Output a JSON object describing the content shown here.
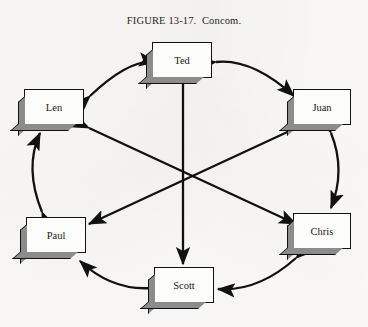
{
  "figure": {
    "caption": "FIGURE 13-17.  Concom.",
    "background_color": "#fbfaf8",
    "ink_color": "#111111",
    "box_fill_color": "#fdfdfb",
    "box_shadow_color": "#8c8c8c"
  },
  "diagram": {
    "type": "directed-graph",
    "layout": "hexagonal-ring-with-diagonals",
    "node_count": 6,
    "edge_count": 9,
    "nodes": [
      {
        "id": "ted",
        "label": "Ted",
        "x": 182,
        "y": 60,
        "w": 60,
        "h": 36
      },
      {
        "id": "juan",
        "label": "Juan",
        "x": 322,
        "y": 107,
        "w": 58,
        "h": 36
      },
      {
        "id": "chris",
        "label": "Chris",
        "x": 322,
        "y": 231,
        "w": 58,
        "h": 36
      },
      {
        "id": "scott",
        "label": "Scott",
        "x": 184,
        "y": 285,
        "w": 60,
        "h": 36
      },
      {
        "id": "paul",
        "label": "Paul",
        "x": 56,
        "y": 235,
        "w": 60,
        "h": 36
      },
      {
        "id": "len",
        "label": "Len",
        "x": 54,
        "y": 107,
        "w": 60,
        "h": 36
      }
    ],
    "ring_edges": [
      {
        "from": "len",
        "to": "ted",
        "bidirectional": true,
        "style": "arc"
      },
      {
        "from": "ted",
        "to": "juan",
        "bidirectional": true,
        "style": "arc"
      },
      {
        "from": "juan",
        "to": "chris",
        "bidirectional": true,
        "style": "arc"
      },
      {
        "from": "chris",
        "to": "scott",
        "bidirectional": true,
        "style": "arc"
      },
      {
        "from": "scott",
        "to": "paul",
        "bidirectional": true,
        "style": "arc"
      },
      {
        "from": "paul",
        "to": "len",
        "bidirectional": true,
        "style": "arc"
      }
    ],
    "diagonal_edges": [
      {
        "from": "ted",
        "to": "scott",
        "bidirectional": true,
        "style": "straight"
      },
      {
        "from": "len",
        "to": "chris",
        "bidirectional": true,
        "style": "straight"
      },
      {
        "from": "juan",
        "to": "paul",
        "bidirectional": true,
        "style": "straight"
      }
    ]
  }
}
